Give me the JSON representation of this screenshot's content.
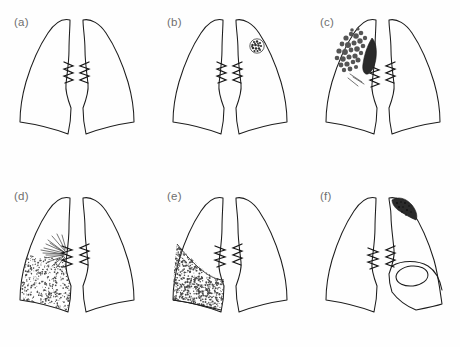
{
  "figure": {
    "width": 460,
    "height": 347,
    "background_color": "#fefefe",
    "line_color": "#1c1c1c",
    "label_color": "#6f6f6f",
    "grid": {
      "rows": 2,
      "columns": 3
    }
  },
  "panels": [
    {
      "id": "a",
      "label": "(a)",
      "row": 0,
      "column": 0,
      "finding": "normal",
      "description": "Normal chest outline with both lung fields clear",
      "features": {
        "nodule": false,
        "cluster": false,
        "spiculated_mass": false,
        "stipple_fill": false,
        "apical_cap": false,
        "cavity_ring": false,
        "hilar_mass": false
      }
    },
    {
      "id": "b",
      "label": "(b)",
      "row": 0,
      "column": 1,
      "finding": "solitary pulmonary nodule",
      "description": "Single round stippled nodule in the upper zone of the right-hand lung field",
      "features": {
        "nodule": true,
        "nodule_side": "right-field",
        "nodule_zone": "upper",
        "cluster": false,
        "spiculated_mass": false,
        "stipple_fill": false,
        "apical_cap": false,
        "cavity_ring": false,
        "hilar_mass": false
      }
    },
    {
      "id": "c",
      "label": "(c)",
      "row": 0,
      "column": 2,
      "finding": "multiple nodular opacities with hilar mass",
      "description": "Cluster of irregular nodular opacities in the left-hand upper zone with an adjacent dark hilar mass",
      "features": {
        "nodule": false,
        "cluster": true,
        "cluster_side": "left-field",
        "cluster_zone": "upper",
        "spiculated_mass": false,
        "stipple_fill": false,
        "apical_cap": false,
        "cavity_ring": false,
        "hilar_mass": true
      }
    },
    {
      "id": "d",
      "label": "(d)",
      "row": 1,
      "column": 0,
      "finding": "spiculated mass with adjacent infiltrate",
      "description": "Perihilar spiculated mass with radiating lines and stippled density extending to the left-hand base",
      "features": {
        "nodule": false,
        "cluster": false,
        "spiculated_mass": true,
        "spicule_count": 14,
        "stipple_fill": true,
        "stipple_zone": "lower",
        "apical_cap": false,
        "cavity_ring": false,
        "hilar_mass": false
      }
    },
    {
      "id": "e",
      "label": "(e)",
      "row": 1,
      "column": 1,
      "finding": "large basal opacity with meniscus",
      "description": "Dense stippled opacity filling the left-hand lower zone with a concave upper border",
      "features": {
        "nodule": false,
        "cluster": false,
        "spiculated_mass": false,
        "stipple_fill": true,
        "stipple_zone": "lower and mid",
        "meniscus_border": true,
        "apical_cap": false,
        "cavity_ring": false,
        "hilar_mass": false
      }
    },
    {
      "id": "f",
      "label": "(f)",
      "row": 1,
      "column": 2,
      "finding": "apical opacity with cavity",
      "description": "Dense stippled apical cap on the right-hand lung with an oval ring cavity in the mid zone below",
      "features": {
        "nodule": false,
        "cluster": false,
        "spiculated_mass": false,
        "stipple_fill": false,
        "apical_cap": true,
        "apical_cap_side": "right-field",
        "cavity_ring": true,
        "cavity_shape": "oval",
        "hilar_mass": false
      }
    }
  ]
}
